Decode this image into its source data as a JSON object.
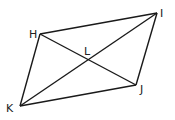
{
  "diagram": {
    "type": "parallelogram-with-diagonals",
    "points": {
      "H": {
        "label": "H",
        "x": 40,
        "y": 34
      },
      "I": {
        "label": "I",
        "x": 157,
        "y": 13
      },
      "J": {
        "label": "J",
        "x": 136,
        "y": 85
      },
      "K": {
        "label": "K",
        "x": 20,
        "y": 106
      },
      "L": {
        "label": "L",
        "x": 89,
        "y": 59
      }
    },
    "sides": [
      "HI",
      "IJ",
      "JK",
      "KH"
    ],
    "diagonals": [
      "HJ",
      "IK"
    ],
    "stroke_color": "#1a1a1a"
  }
}
